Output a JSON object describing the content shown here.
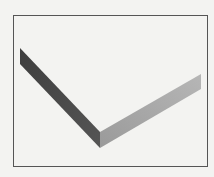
{
  "diagram": {
    "type": "isometric-v-shaped-prism",
    "frame": {
      "x": 13,
      "y": 15,
      "width": 194,
      "height": 151,
      "stroke": "#555555"
    },
    "left_arm": {
      "face_color": "#4a4a4a",
      "points": [
        [
          20,
          48
        ],
        [
          100,
          132
        ],
        [
          100,
          148
        ],
        [
          20,
          64
        ]
      ]
    },
    "right_arm": {
      "face_color": "#a9a9a9",
      "points": [
        [
          100,
          132
        ],
        [
          201,
          74
        ],
        [
          201,
          89
        ],
        [
          100,
          148
        ]
      ]
    },
    "background_color": "#f3f3f1"
  }
}
